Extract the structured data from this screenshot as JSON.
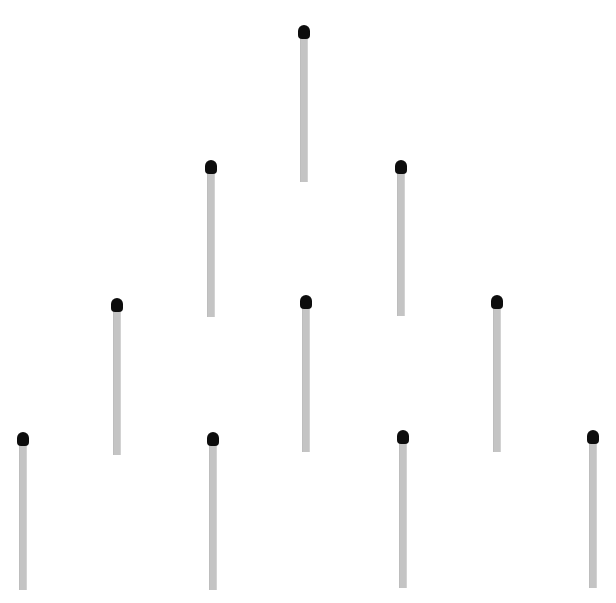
{
  "scene": {
    "background": "#ffffff",
    "stick_color": "#c4c4c4",
    "head_color": "#0d0d0d",
    "arrangement": "triangle of matchsticks, rows of 1-2-3-4",
    "matches": [
      {
        "id": 1,
        "row": 1,
        "x": 304,
        "top": 25,
        "bottom": 182
      },
      {
        "id": 2,
        "row": 2,
        "x": 211,
        "top": 160,
        "bottom": 317
      },
      {
        "id": 3,
        "row": 2,
        "x": 401,
        "top": 160,
        "bottom": 316
      },
      {
        "id": 4,
        "row": 3,
        "x": 117,
        "top": 298,
        "bottom": 455
      },
      {
        "id": 5,
        "row": 3,
        "x": 306,
        "top": 295,
        "bottom": 452
      },
      {
        "id": 6,
        "row": 3,
        "x": 497,
        "top": 295,
        "bottom": 452
      },
      {
        "id": 7,
        "row": 4,
        "x": 23,
        "top": 432,
        "bottom": 590
      },
      {
        "id": 8,
        "row": 4,
        "x": 213,
        "top": 432,
        "bottom": 590
      },
      {
        "id": 9,
        "row": 4,
        "x": 403,
        "top": 430,
        "bottom": 588
      },
      {
        "id": 10,
        "row": 4,
        "x": 593,
        "top": 430,
        "bottom": 588
      }
    ]
  }
}
